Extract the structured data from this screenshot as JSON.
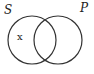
{
  "diagram": {
    "type": "venn",
    "sets": [
      {
        "label": "S"
      },
      {
        "label": "P"
      }
    ],
    "marks": [
      {
        "text": "x",
        "region": "S only"
      }
    ]
  }
}
